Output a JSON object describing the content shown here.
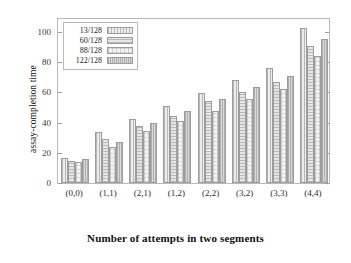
{
  "chart_data": {
    "type": "bar",
    "title": "",
    "xlabel": "Number of attempts in two segments",
    "ylabel": "assay-completion time",
    "categories": [
      "(0,0)",
      "(1,1)",
      "(2,1)",
      "(1,2)",
      "(2,2)",
      "(3,2)",
      "(3,3)",
      "(4,4)"
    ],
    "series": [
      {
        "name": "13/128",
        "values": [
          16.5,
          33.5,
          42.5,
          51.0,
          59.5,
          68.5,
          76.0,
          102.5
        ]
      },
      {
        "name": "60/128",
        "values": [
          14.5,
          29.0,
          37.5,
          44.5,
          54.5,
          60.5,
          67.0,
          90.5
        ]
      },
      {
        "name": "88/128",
        "values": [
          14.0,
          24.0,
          34.5,
          41.0,
          48.0,
          55.5,
          62.5,
          84.0
        ]
      },
      {
        "name": "122/128",
        "values": [
          16.0,
          27.5,
          39.5,
          47.5,
          56.0,
          63.5,
          71.0,
          95.5
        ]
      }
    ],
    "ylim": [
      0,
      110
    ],
    "yticks": [
      0,
      20,
      40,
      60,
      80,
      100
    ],
    "ytick_labels": [
      "0",
      "20",
      "40",
      "60",
      "80",
      "100"
    ],
    "grid": false,
    "legend_position": "top-left",
    "legend_entries": [
      "13/128",
      "60/128",
      "88/128",
      "122/128"
    ],
    "colors": {
      "series_13": "#ececec",
      "series_60": "#e6e6e6",
      "series_88": "#f3f3f3",
      "series_122": "#d9d9d9",
      "axis": "#b9b9b9",
      "text": "#1a1a1a",
      "background": "#ffffff"
    }
  }
}
